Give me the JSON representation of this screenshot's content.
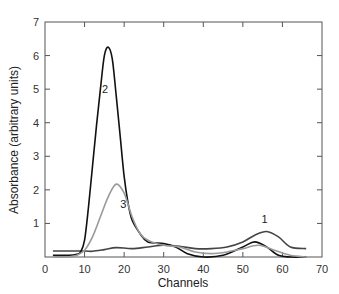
{
  "chart_data": {
    "type": "line",
    "title": "",
    "xlabel": "Channels",
    "ylabel": "Absorbance (arbitrary units)",
    "xlim": [
      0,
      70
    ],
    "ylim": [
      0,
      7
    ],
    "xticks": [
      0,
      10,
      20,
      30,
      40,
      50,
      60,
      70
    ],
    "yticks": [
      1,
      2,
      3,
      4,
      5,
      6,
      7
    ],
    "grid": false,
    "legend": "none (curves labelled inline)",
    "series": [
      {
        "name": "1",
        "color": "#444444",
        "label_at": [
          55.5,
          1.0
        ],
        "x": [
          2,
          5,
          10,
          12,
          15,
          18,
          22,
          26,
          30,
          34,
          38,
          42,
          46,
          50,
          53,
          56,
          59,
          62,
          66
        ],
        "y": [
          0.18,
          0.18,
          0.18,
          0.17,
          0.22,
          0.28,
          0.25,
          0.3,
          0.35,
          0.32,
          0.25,
          0.25,
          0.3,
          0.45,
          0.65,
          0.76,
          0.6,
          0.3,
          0.25
        ]
      },
      {
        "name": "2",
        "color": "#111111",
        "label_at": [
          15.2,
          4.9
        ],
        "x": [
          2,
          6,
          8,
          9,
          10,
          11,
          12,
          13,
          14,
          15,
          16,
          17,
          18,
          19,
          20,
          21,
          22,
          24,
          26,
          30,
          33,
          36,
          40,
          45,
          50,
          53,
          56,
          59,
          62,
          66
        ],
        "y": [
          0.05,
          0.05,
          0.08,
          0.15,
          0.5,
          1.5,
          2.7,
          3.9,
          5.0,
          6.0,
          6.25,
          5.9,
          4.8,
          3.6,
          2.4,
          1.6,
          1.1,
          0.7,
          0.45,
          0.4,
          0.3,
          0.1,
          0.0,
          0.05,
          0.3,
          0.45,
          0.3,
          0.05,
          0.0,
          0.0
        ]
      },
      {
        "name": "3",
        "color": "#9a9a9a",
        "label_at": [
          19.8,
          1.45
        ],
        "x": [
          2,
          6,
          8,
          10,
          12,
          14,
          16,
          18,
          20,
          22,
          24,
          26,
          30,
          34,
          38,
          42,
          46,
          50,
          54,
          58,
          62,
          66
        ],
        "y": [
          0.0,
          0.0,
          0.05,
          0.2,
          0.6,
          1.2,
          1.8,
          2.17,
          1.9,
          1.2,
          0.7,
          0.5,
          0.35,
          0.3,
          0.15,
          0.1,
          0.15,
          0.25,
          0.35,
          0.2,
          0.05,
          0.0
        ]
      }
    ]
  }
}
